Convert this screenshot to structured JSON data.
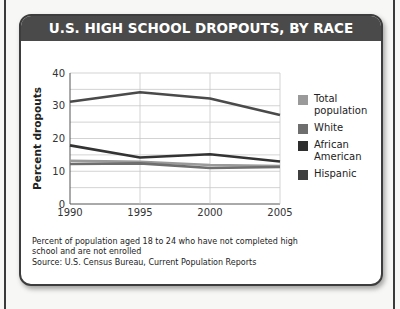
{
  "chart_data": {
    "type": "line",
    "title": "U.S. HIGH SCHOOL DROPOUTS, BY RACE",
    "xlabel": "",
    "ylabel": "Percent dropouts",
    "x": [
      1990,
      1995,
      2000,
      2005
    ],
    "x_tick_labels": [
      "1990",
      "1995",
      "2000",
      "2005"
    ],
    "y_ticks": [
      0,
      10,
      20,
      30,
      40
    ],
    "ylim": [
      0,
      40
    ],
    "grid": true,
    "legend_position": "right",
    "series": [
      {
        "name": "Total population",
        "color": "#9a9a9a",
        "values": [
          13.2,
          12.9,
          11.9,
          11.6
        ]
      },
      {
        "name": "White",
        "color": "#6e6e6e",
        "values": [
          12.2,
          12.4,
          11.0,
          11.3
        ]
      },
      {
        "name": "African American",
        "color": "#333333",
        "values": [
          17.9,
          14.2,
          15.2,
          13.0
        ]
      },
      {
        "name": "Hispanic",
        "color": "#4a4a4a",
        "values": [
          31.2,
          34.1,
          32.2,
          27.2
        ]
      }
    ],
    "note": "Percent of population aged 18 to 24 who have not completed high school and are not enrolled",
    "source": "Source: U.S. Census Bureau, Current Population Reports"
  },
  "header": {
    "title": "U.S. HIGH SCHOOL DROPOUTS, BY RACE"
  },
  "axis": {
    "ylabel": "Percent dropouts",
    "y_ticks": [
      "0",
      "10",
      "20",
      "30",
      "40"
    ],
    "x_ticks": [
      "1990",
      "1995",
      "2000",
      "2005"
    ]
  },
  "legend": [
    {
      "label_line1": "Total",
      "label_line2": "population",
      "color": "#9a9a9a"
    },
    {
      "label_line1": "White",
      "label_line2": "",
      "color": "#6e6e6e"
    },
    {
      "label_line1": "African",
      "label_line2": "American",
      "color": "#2e2e2e"
    },
    {
      "label_line1": "Hispanic",
      "label_line2": "",
      "color": "#3f3f3f"
    }
  ],
  "footer": {
    "note": "Percent of population aged 18 to 24 who have not completed high school and are not enrolled",
    "source": "Source: U.S. Census Bureau, Current Population Reports"
  }
}
